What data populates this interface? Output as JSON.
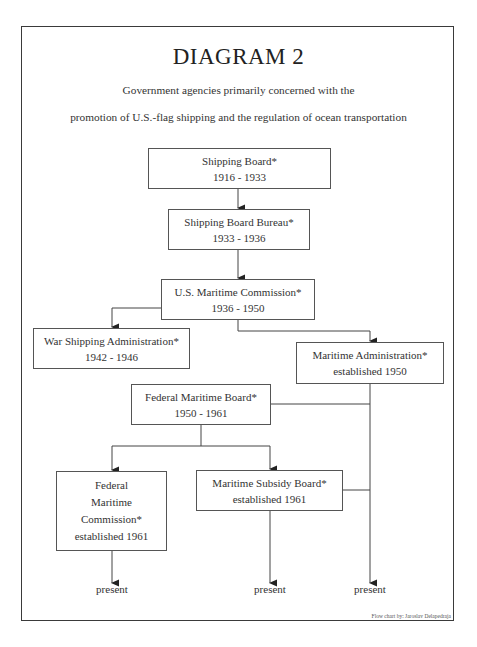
{
  "diagram": {
    "title": "DIAGRAM 2",
    "subtitle_line1": "Government agencies primarily concerned with the",
    "subtitle_line2": "promotion of U.S.-flag shipping and the regulation of ocean transportation",
    "nodes": [
      {
        "id": "shipping-board",
        "name": "Shipping Board*",
        "dates": "1916 - 1933"
      },
      {
        "id": "shipping-board-bureau",
        "name": "Shipping Board Bureau*",
        "dates": "1933 - 1936"
      },
      {
        "id": "us-maritime-commission",
        "name": "U.S. Maritime Commission*",
        "dates": "1936 - 1950"
      },
      {
        "id": "war-shipping-administration",
        "name": "War Shipping Administration*",
        "dates": "1942 - 1946"
      },
      {
        "id": "maritime-administration",
        "name": "Maritime Administration*",
        "dates": "established 1950"
      },
      {
        "id": "federal-maritime-board",
        "name": "Federal Maritime Board*",
        "dates": "1950 - 1961"
      },
      {
        "id": "federal-maritime-commission",
        "name_lines": [
          "Federal",
          "Maritime",
          "Commission*"
        ],
        "dates": "established 1961"
      },
      {
        "id": "maritime-subsidy-board",
        "name": "Maritime Subsidy Board*",
        "dates": "established 1961"
      }
    ],
    "edges": [
      [
        "shipping-board",
        "shipping-board-bureau"
      ],
      [
        "shipping-board-bureau",
        "us-maritime-commission"
      ],
      [
        "us-maritime-commission",
        "war-shipping-administration"
      ],
      [
        "us-maritime-commission",
        "maritime-administration"
      ],
      [
        "federal-maritime-board",
        "federal-maritime-commission"
      ],
      [
        "federal-maritime-board",
        "maritime-subsidy-board"
      ],
      [
        "federal-maritime-board",
        "maritime-administration-line"
      ],
      [
        "maritime-subsidy-board",
        "maritime-administration-line"
      ]
    ],
    "terminals": [
      "present",
      "present",
      "present"
    ],
    "credit": "Flow chart by:  Jaroslav Delapedraja"
  }
}
